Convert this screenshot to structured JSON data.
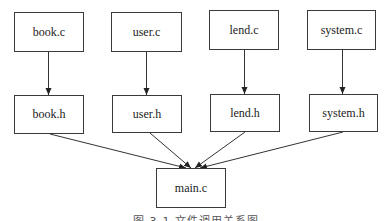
{
  "diagram": {
    "type": "dependency-graph",
    "sources": [
      {
        "id": "book_c",
        "label": "book.c"
      },
      {
        "id": "user_c",
        "label": "user.c"
      },
      {
        "id": "lend_c",
        "label": "lend.c"
      },
      {
        "id": "system_c",
        "label": "system.c"
      }
    ],
    "headers": [
      {
        "id": "book_h",
        "label": "book.h"
      },
      {
        "id": "user_h",
        "label": "user.h"
      },
      {
        "id": "lend_h",
        "label": "lend.h"
      },
      {
        "id": "system_h",
        "label": "system.h"
      }
    ],
    "main": {
      "id": "main_c",
      "label": "main.c"
    },
    "edges": [
      [
        "book.c",
        "book.h"
      ],
      [
        "user.c",
        "user.h"
      ],
      [
        "lend.c",
        "lend.h"
      ],
      [
        "system.c",
        "system.h"
      ],
      [
        "book.h",
        "main.c"
      ],
      [
        "user.h",
        "main.c"
      ],
      [
        "lend.h",
        "main.c"
      ],
      [
        "system.h",
        "main.c"
      ]
    ],
    "caption": "图 3-1 文件调用关系图"
  }
}
